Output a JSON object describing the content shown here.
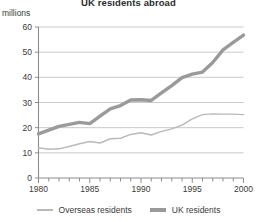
{
  "chart_data": {
    "type": "line",
    "title": "UK residents abroad",
    "ylabel": "millions",
    "xlabel": "",
    "unit_label": "millions",
    "grid": true,
    "legend_position": "bottom",
    "ylim": [
      0,
      60
    ],
    "xlim": [
      1980,
      2000
    ],
    "ytick_values": [
      0,
      10,
      20,
      30,
      40,
      50,
      60
    ],
    "ytick_labels": [
      "0",
      "10",
      "20",
      "30",
      "40",
      "50",
      "60"
    ],
    "xtick_labels": [
      "1980",
      "1985",
      "1990",
      "1995",
      "2000"
    ],
    "xtick_values": [
      1980,
      1985,
      1990,
      1995,
      2000
    ],
    "minor_xticks_every": 1,
    "x": [
      1980,
      1981,
      1982,
      1983,
      1984,
      1985,
      1986,
      1987,
      1988,
      1989,
      1990,
      1991,
      1992,
      1993,
      1994,
      1995,
      1996,
      1997,
      1998,
      1999,
      2000
    ],
    "series": [
      {
        "name": "Overseas residents",
        "color": "#b9b9b9",
        "width": 1.4,
        "values": [
          12.0,
          11.4,
          11.6,
          12.5,
          13.6,
          14.5,
          13.9,
          15.6,
          15.8,
          17.3,
          18.0,
          17.1,
          18.5,
          19.5,
          21.0,
          23.5,
          25.2,
          25.5,
          25.4,
          25.4,
          25.2
        ]
      },
      {
        "name": "UK residents",
        "color": "#9a9a9a",
        "width": 3.4,
        "values": [
          17.5,
          19.0,
          20.5,
          21.3,
          22.1,
          21.6,
          24.6,
          27.5,
          28.8,
          31.0,
          31.1,
          30.8,
          33.8,
          36.7,
          39.9,
          41.3,
          42.1,
          45.9,
          50.9,
          53.9,
          56.8
        ]
      }
    ]
  },
  "legend": {
    "items": [
      {
        "label": "Overseas residents"
      },
      {
        "label": "UK residents"
      }
    ]
  }
}
